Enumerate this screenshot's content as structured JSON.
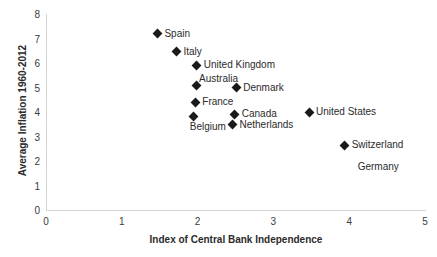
{
  "chart_data": {
    "type": "scatter",
    "title": "",
    "xlabel": "Index of Central Bank Independence",
    "ylabel": "Average Inflation 1960-2012",
    "xlim": [
      0,
      5
    ],
    "ylim": [
      0,
      8
    ],
    "xticks": [
      "0",
      "1",
      "2",
      "3",
      "4",
      "5"
    ],
    "yticks": [
      "0",
      "1",
      "2",
      "3",
      "4",
      "5",
      "6",
      "7",
      "8"
    ],
    "grid": false,
    "legend": "none",
    "marker_style": "black-diamond",
    "points": [
      {
        "label": "Spain",
        "x": 1.47,
        "y": 7.2,
        "label_pos": "right"
      },
      {
        "label": "Italy",
        "x": 1.72,
        "y": 6.45,
        "label_pos": "right"
      },
      {
        "label": "United Kingdom",
        "x": 1.99,
        "y": 5.9,
        "label_pos": "right"
      },
      {
        "label": "Australia",
        "x": 1.98,
        "y": 5.1,
        "label_pos": "above-right"
      },
      {
        "label": "Denmark",
        "x": 2.51,
        "y": 5.0,
        "label_pos": "right"
      },
      {
        "label": "France",
        "x": 1.97,
        "y": 4.4,
        "label_pos": "right"
      },
      {
        "label": "Belgium",
        "x": 1.95,
        "y": 3.8,
        "label_pos": "below"
      },
      {
        "label": "Canada",
        "x": 2.49,
        "y": 3.9,
        "label_pos": "right"
      },
      {
        "label": "Netherlands",
        "x": 2.46,
        "y": 3.47,
        "label_pos": "right"
      },
      {
        "label": "United States",
        "x": 3.47,
        "y": 4.0,
        "label_pos": "right"
      },
      {
        "label": "Switzerland",
        "x": 3.94,
        "y": 2.65,
        "label_pos": "right",
        "label2": "Germany"
      }
    ]
  }
}
